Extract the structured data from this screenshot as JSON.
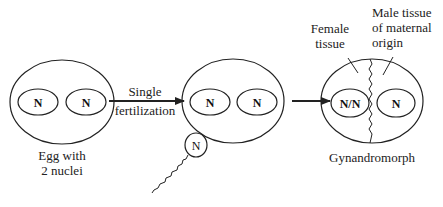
{
  "diagram": {
    "stages": [
      {
        "id": "egg",
        "caption_lines": [
          "Egg with",
          "2 nuclei"
        ],
        "nuclei": [
          "N",
          "N"
        ]
      },
      {
        "id": "fertilized-egg",
        "nuclei": [
          "N",
          "N"
        ],
        "sperm_nucleus": "N"
      },
      {
        "id": "gynandromorph",
        "caption": "Gynandromorph",
        "nuclei": [
          "N/N",
          "N"
        ],
        "annotations": {
          "female": [
            "Female",
            "tissue"
          ],
          "male": [
            "Male tissue",
            "of maternal",
            "origin"
          ]
        }
      }
    ],
    "arrows": [
      {
        "label_above": "Single",
        "label_below": "fertilization"
      },
      {
        "label_above": "",
        "label_below": ""
      }
    ],
    "colors": {
      "stroke": "#222222",
      "background": "#ffffff"
    }
  }
}
